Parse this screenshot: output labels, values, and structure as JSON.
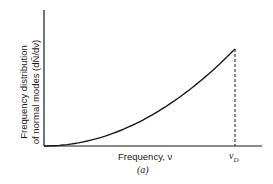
{
  "chart_data": {
    "type": "line",
    "title": "",
    "xlabel": "Frequency, ν",
    "ylabel": "Frequency distribution of normal modes (dÑ/dν)",
    "ylabel_line1": "Frequency distribution",
    "ylabel_line2": "of normal modes (dÑ/dν)",
    "x_tick_labels": [
      "ν_D"
    ],
    "x_tick_symbol": "ν",
    "x_tick_sub": "D",
    "sublabel": "(a)",
    "series": [
      {
        "name": "Debye frequency distribution (∝ ν²)",
        "x": [
          0,
          0.1,
          0.2,
          0.3,
          0.4,
          0.5,
          0.6,
          0.7,
          0.8,
          0.9,
          1.0
        ],
        "values": [
          0,
          0.01,
          0.04,
          0.09,
          0.16,
          0.25,
          0.36,
          0.49,
          0.64,
          0.81,
          1.0
        ]
      }
    ],
    "annotations": [
      {
        "type": "vertical-dashed-line",
        "x": 1.0,
        "label": "ν_D"
      }
    ],
    "xlim": [
      0,
      1.1
    ],
    "ylim": [
      0,
      1.0
    ],
    "grid": false,
    "legend": "none"
  }
}
